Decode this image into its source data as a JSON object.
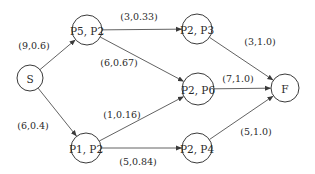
{
  "diagram": {
    "type": "directed-graph",
    "nodes": [
      {
        "id": "S",
        "label": "S",
        "x": 30,
        "y": 78,
        "r": 13
      },
      {
        "id": "P5P2",
        "label": "P5, P2",
        "x": 87,
        "y": 30,
        "r": 15
      },
      {
        "id": "P2P3",
        "label": "P2, P3",
        "x": 197,
        "y": 29,
        "r": 15
      },
      {
        "id": "P2P6",
        "label": "P2, P6",
        "x": 198,
        "y": 89,
        "r": 16
      },
      {
        "id": "F",
        "label": "F",
        "x": 285,
        "y": 88,
        "r": 14
      },
      {
        "id": "P1P2",
        "label": "P1, P2",
        "x": 86,
        "y": 148,
        "r": 15
      },
      {
        "id": "P2P4",
        "label": "P2, P4",
        "x": 197,
        "y": 148,
        "r": 15
      }
    ],
    "edges": [
      {
        "from": "S",
        "to": "P5P2",
        "label": "(9,0.6)",
        "lx": 34,
        "ly": 45
      },
      {
        "from": "S",
        "to": "P1P2",
        "label": "(6,0.4)",
        "lx": 33,
        "ly": 125
      },
      {
        "from": "P5P2",
        "to": "P2P3",
        "label": "(3,0.33)",
        "lx": 139,
        "ly": 16
      },
      {
        "from": "P5P2",
        "to": "P2P6",
        "label": "(6,0.67)",
        "lx": 119,
        "ly": 62
      },
      {
        "from": "P1P2",
        "to": "P2P6",
        "label": "(1,0.16)",
        "lx": 122,
        "ly": 114
      },
      {
        "from": "P1P2",
        "to": "P2P4",
        "label": "(5,0.84)",
        "lx": 138,
        "ly": 161
      },
      {
        "from": "P2P3",
        "to": "F",
        "label": "(3,1.0)",
        "lx": 260,
        "ly": 41
      },
      {
        "from": "P2P6",
        "to": "F",
        "label": "(7,1.0)",
        "lx": 238,
        "ly": 78
      },
      {
        "from": "P2P4",
        "to": "F",
        "label": "(5,1.0)",
        "lx": 256,
        "ly": 131
      }
    ]
  },
  "colors": {
    "stroke": "#3a3a3a",
    "text": "#2a2a2a",
    "background": "#ffffff"
  }
}
